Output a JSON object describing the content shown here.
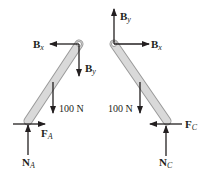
{
  "diagram": {
    "type": "free-body diagrams",
    "colors": {
      "arrow": "#231f20",
      "bar_fill": "#d9d9d9",
      "bar_stroke": "#9a9a9a",
      "background": "#ffffff"
    },
    "left": {
      "name": "member AB",
      "forces": {
        "bx": {
          "main": "B",
          "sub": "x",
          "direction": "left"
        },
        "by": {
          "main": "B",
          "sub": "y",
          "direction": "down"
        },
        "weight": {
          "label": "100 N",
          "direction": "down"
        },
        "friction": {
          "main": "F",
          "sub": "A",
          "direction": "right"
        },
        "normal": {
          "main": "N",
          "sub": "A",
          "direction": "up"
        }
      }
    },
    "right": {
      "name": "member BC",
      "forces": {
        "by": {
          "main": "B",
          "sub": "y",
          "direction": "up"
        },
        "bx": {
          "main": "B",
          "sub": "x",
          "direction": "right"
        },
        "weight": {
          "label": "100 N",
          "direction": "down"
        },
        "friction": {
          "main": "F",
          "sub": "C",
          "direction": "left"
        },
        "normal": {
          "main": "N",
          "sub": "C",
          "direction": "up"
        }
      }
    }
  }
}
